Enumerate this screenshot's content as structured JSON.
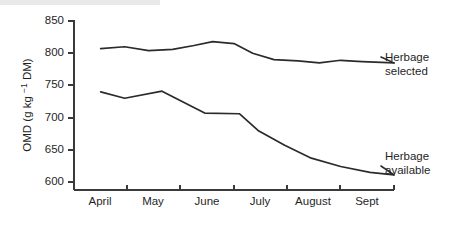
{
  "chart_data": {
    "type": "line",
    "title": "",
    "xlabel": "",
    "ylabel": "OMD (g kg −1 DM)",
    "ylabel_parts": {
      "prefix": "OMD (g kg ",
      "superscript": "−1",
      "suffix": " DM)"
    },
    "categories": [
      "April",
      "May",
      "June",
      "July",
      "August",
      "Sept"
    ],
    "xlim": [
      0,
      6
    ],
    "ylim": [
      590,
      855
    ],
    "yticks": [
      600,
      650,
      700,
      750,
      800,
      850
    ],
    "ytick_labels": [
      "600",
      "650",
      "700",
      "750",
      "800",
      "850"
    ],
    "grid": false,
    "legend_position": "right-inline-annotations",
    "line_color": "#2b2b2b",
    "axis_color": "#3a3a3a",
    "series": [
      {
        "name": "Herbage selected",
        "label_line1": "Herbage",
        "label_line2": "selected",
        "x": [
          0.5,
          0.95,
          1.4,
          1.85,
          2.25,
          2.6,
          3.0,
          3.35,
          3.75,
          4.2,
          4.6,
          5.0,
          5.4,
          6.0
        ],
        "values": [
          807,
          810,
          804,
          806,
          812,
          818,
          815,
          800,
          790,
          788,
          785,
          789,
          787,
          785
        ]
      },
      {
        "name": "Herbage available",
        "label_line1": "Herbage",
        "label_line2": "available",
        "x": [
          0.5,
          0.95,
          1.65,
          2.1,
          2.45,
          3.1,
          3.45,
          3.95,
          4.45,
          5.0,
          5.55,
          6.0
        ],
        "values": [
          740,
          730,
          741,
          722,
          707,
          706,
          680,
          657,
          637,
          624,
          615,
          611
        ]
      }
    ],
    "annotations": [
      {
        "series": "Herbage selected",
        "text_line1": "Herbage",
        "text_line2": "selected",
        "leader_from_x": 6.0,
        "leader_from_y": 785
      },
      {
        "series": "Herbage available",
        "text_line1": "Herbage",
        "text_line2": "available",
        "leader_from_x": 6.0,
        "leader_from_y": 611
      }
    ]
  }
}
